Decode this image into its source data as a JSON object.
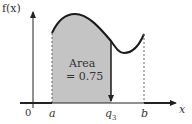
{
  "figure": {
    "y_axis_label": "f(x)",
    "x_axis_label": "x",
    "origin_label": "0",
    "tick_labels": {
      "a": "a",
      "q3": "q",
      "q3_sub": "3",
      "b": "b"
    },
    "annotation": {
      "line1": "Area",
      "line2": "= 0.75"
    },
    "colors": {
      "shade": "#c4c4c4",
      "curve": "#1a1a1a",
      "axis": "#222222"
    }
  }
}
